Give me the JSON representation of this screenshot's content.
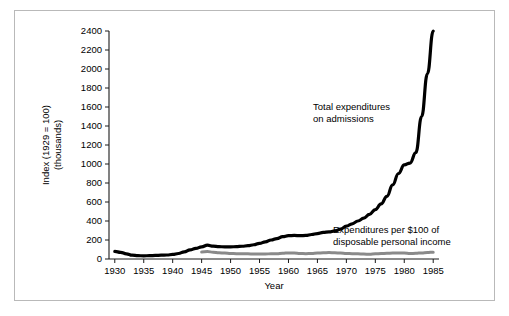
{
  "chart_data": {
    "type": "line",
    "title": "",
    "xlabel": "Year",
    "ylabel": "Index (1929 = 100) (thousands)",
    "ylabel_line1": "Index (1929 = 100)",
    "ylabel_line2": "(thousands)",
    "xlim": [
      1929,
      1986
    ],
    "ylim": [
      0,
      2400
    ],
    "grid": false,
    "legend_position": "inline-annotations",
    "xticks": [
      1930,
      1935,
      1940,
      1945,
      1950,
      1955,
      1960,
      1965,
      1970,
      1975,
      1980,
      1985
    ],
    "xtick_labels": [
      "1930",
      "1935",
      "1940",
      "1945",
      "1950",
      "1955",
      "1960",
      "1965",
      "1970",
      "1975",
      "1980",
      "1985"
    ],
    "yticks": [
      0,
      200,
      400,
      600,
      800,
      1000,
      1200,
      1400,
      1600,
      1800,
      2000,
      2200,
      2400
    ],
    "ytick_labels": [
      "0",
      "200",
      "400",
      "600",
      "800",
      "1000",
      "1200",
      "1400",
      "1600",
      "1800",
      "2000",
      "2200",
      "2400"
    ],
    "series": [
      {
        "name": "Total expenditures on admissions",
        "color": "#000000",
        "linewidth": 3.2,
        "annotation_line1": "Total expenditures",
        "annotation_line2": "on admissions",
        "x": [
          1930,
          1931,
          1932,
          1933,
          1934,
          1935,
          1936,
          1937,
          1938,
          1939,
          1940,
          1941,
          1942,
          1943,
          1944,
          1945,
          1946,
          1947,
          1948,
          1949,
          1950,
          1951,
          1952,
          1953,
          1954,
          1955,
          1956,
          1957,
          1958,
          1959,
          1960,
          1961,
          1962,
          1963,
          1964,
          1965,
          1966,
          1967,
          1968,
          1969,
          1970,
          1971,
          1972,
          1973,
          1974,
          1975,
          1976,
          1977,
          1978,
          1979,
          1980,
          1981,
          1982,
          1983,
          1984,
          1985
        ],
        "values": [
          80,
          70,
          55,
          40,
          35,
          33,
          35,
          38,
          40,
          42,
          48,
          58,
          75,
          95,
          112,
          128,
          145,
          135,
          130,
          128,
          128,
          130,
          134,
          140,
          150,
          165,
          180,
          200,
          215,
          235,
          245,
          248,
          245,
          248,
          258,
          268,
          280,
          285,
          295,
          315,
          345,
          370,
          400,
          430,
          470,
          520,
          580,
          660,
          780,
          900,
          990,
          1010,
          1120,
          1500,
          1950,
          2400
        ]
      },
      {
        "name": "Expenditures per $100 of disposable personal income",
        "color": "#8a8a8a",
        "linewidth": 3.0,
        "annotation_line1": "Expenditures per $100 of",
        "annotation_line2": "disposable personal income",
        "x": [
          1945,
          1946,
          1947,
          1948,
          1949,
          1950,
          1951,
          1952,
          1953,
          1954,
          1955,
          1956,
          1957,
          1958,
          1959,
          1960,
          1961,
          1962,
          1963,
          1964,
          1965,
          1966,
          1967,
          1968,
          1969,
          1970,
          1971,
          1972,
          1973,
          1974,
          1975,
          1976,
          1977,
          1978,
          1979,
          1980,
          1981,
          1982,
          1983,
          1984,
          1985
        ],
        "values": [
          75,
          78,
          72,
          66,
          62,
          58,
          56,
          55,
          54,
          52,
          52,
          53,
          55,
          56,
          60,
          64,
          62,
          58,
          56,
          58,
          62,
          66,
          68,
          66,
          62,
          58,
          56,
          54,
          52,
          50,
          54,
          58,
          60,
          62,
          64,
          62,
          58,
          60,
          64,
          68,
          72
        ]
      }
    ]
  }
}
